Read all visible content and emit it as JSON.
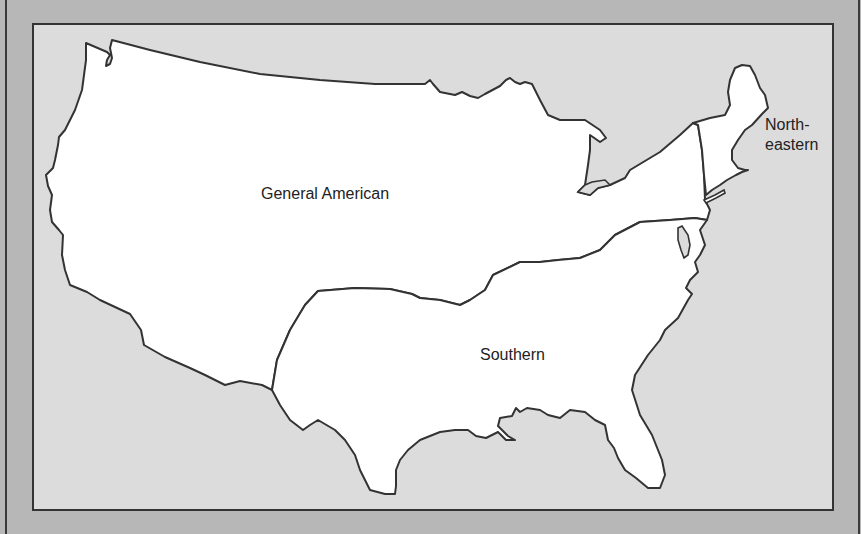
{
  "map": {
    "type": "dialect-regions",
    "subject": "United States (contiguous)",
    "regions": [
      {
        "id": "general-american",
        "label": "General American"
      },
      {
        "id": "southern",
        "label": "Southern"
      },
      {
        "id": "northeastern",
        "label_line1": "North-",
        "label_line2": "eastern"
      }
    ],
    "colors": {
      "land": "#ffffff",
      "inner_background": "#dcdcdc",
      "outer_background": "#b7b7b7",
      "outline": "#333333"
    }
  }
}
